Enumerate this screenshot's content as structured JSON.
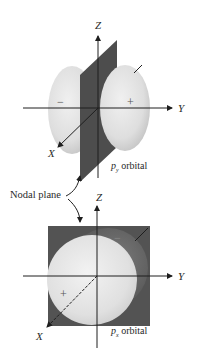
{
  "figure": {
    "top_panel": {
      "orbital_name": "p",
      "orbital_subscript": "y",
      "orbital_suffix": " orbital",
      "axes": {
        "z": "Z",
        "y": "Y",
        "x": "X"
      },
      "lobes": {
        "left_sign": "−",
        "right_sign": "+"
      }
    },
    "nodal_plane_label": "Nodal plane",
    "bottom_panel": {
      "orbital_name": "p",
      "orbital_subscript": "x",
      "orbital_suffix": " orbital",
      "axes": {
        "z": "Z",
        "y": "Y",
        "x": "X"
      },
      "lobes": {
        "front_sign": "+",
        "back_sign": "−"
      }
    },
    "colors": {
      "lobe_light": "#e6e6e6",
      "lobe_shadow": "#c8c8c8",
      "plane_dark": "#4a4a4a",
      "square_dark": "#555555",
      "axis": "#1e1e1e"
    }
  }
}
